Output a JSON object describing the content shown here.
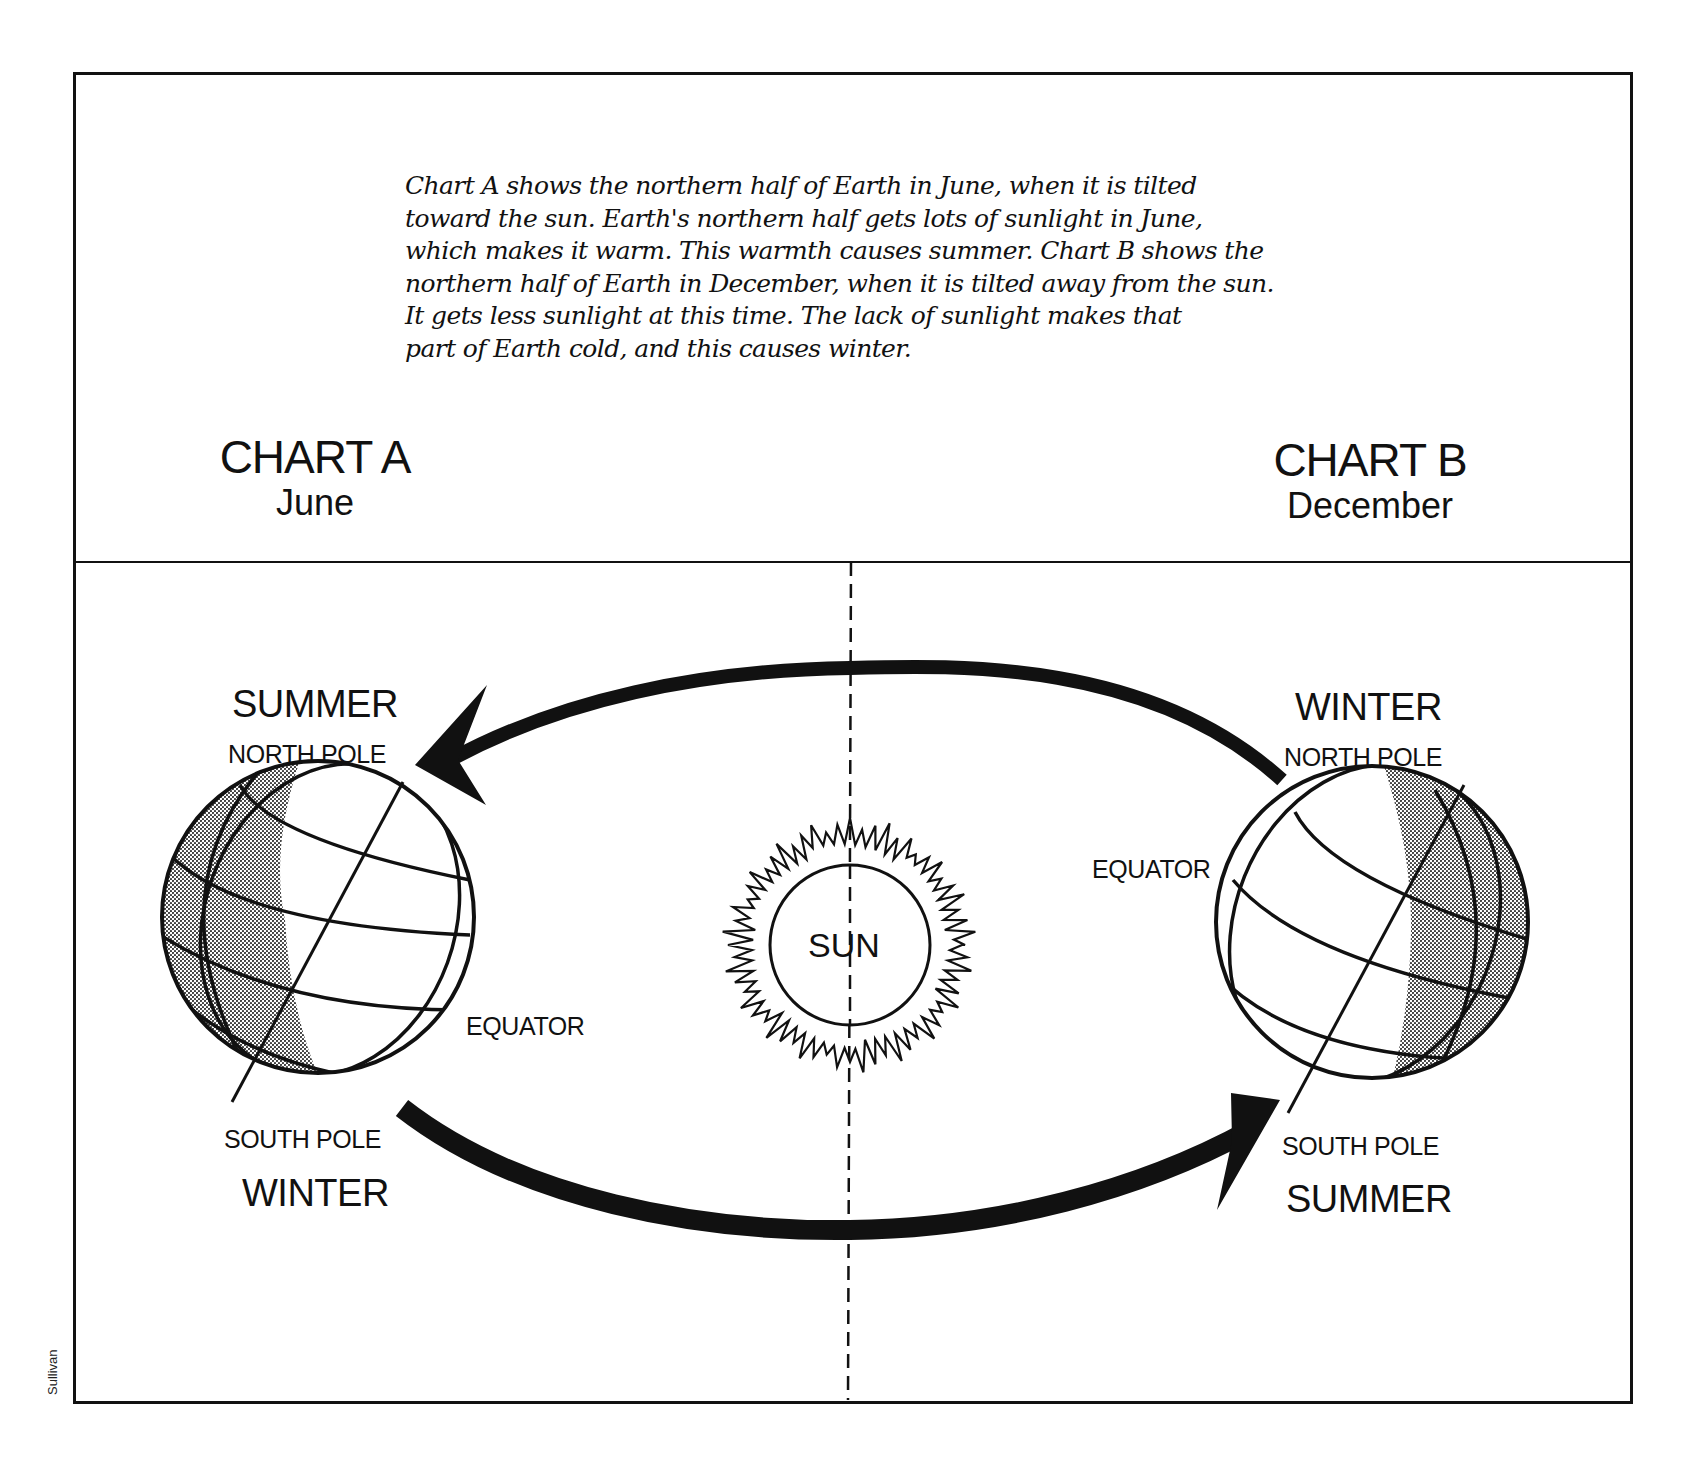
{
  "caption": {
    "lines": [
      "Chart A shows the northern half of Earth in June, when it is tilted",
      "toward the sun. Earth's northern half gets lots of sunlight in June,",
      "which makes it warm. This warmth causes summer. Chart B shows the",
      "northern half of Earth in December, when it is tilted away from the sun.",
      "It gets less sunlight at this time.  The lack of sunlight makes that",
      "part of Earth cold, and this causes winter."
    ]
  },
  "chart_a": {
    "title": "CHART A",
    "month": "June",
    "top_season": "SUMMER",
    "north_pole": "NORTH POLE",
    "equator": "EQUATOR",
    "south_pole": "SOUTH POLE",
    "bottom_season": "WINTER"
  },
  "chart_b": {
    "title": "CHART B",
    "month": "December",
    "top_season": "WINTER",
    "north_pole": "NORTH POLE",
    "equator": "EQUATOR",
    "south_pole": "SOUTH POLE",
    "bottom_season": "SUMMER"
  },
  "sun": {
    "label": "SUN"
  },
  "credit": "Sullivan",
  "colors": {
    "ink": "#111111",
    "shade": "#9a9a9a",
    "background": "#ffffff"
  }
}
